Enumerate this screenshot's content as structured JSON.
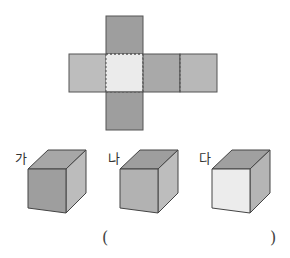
{
  "net": {
    "faces": [
      {
        "pos": "top",
        "color": "#9e9e9e"
      },
      {
        "pos": "left",
        "color": "#bdbdbd"
      },
      {
        "pos": "center",
        "color": "#ebebeb"
      },
      {
        "pos": "right1",
        "color": "#a9a9a9"
      },
      {
        "pos": "right2",
        "color": "#b8b8b8"
      },
      {
        "pos": "bottom",
        "color": "#9e9e9e"
      }
    ]
  },
  "options": [
    {
      "label": "가",
      "front": "#9e9e9e",
      "top": "#a7a7a7",
      "side": "#bcbcbc"
    },
    {
      "label": "나",
      "front": "#b2b2b2",
      "top": "#9e9e9e",
      "side": "#bdbdbd"
    },
    {
      "label": "다",
      "front": "#ececec",
      "top": "#a0a0a0",
      "side": "#b5b5b5"
    }
  ],
  "answer": {
    "open": "(",
    "close": ")"
  }
}
